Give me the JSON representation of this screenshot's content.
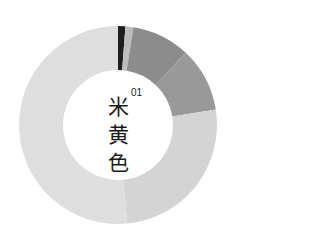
{
  "chart_data": {
    "type": "pie",
    "variant": "donut",
    "index_label": "01",
    "slices": [
      {
        "label": "segment-1",
        "value": 1.2,
        "color": "#1f1f1f"
      },
      {
        "label": "segment-2",
        "value": 1.3,
        "color": "#bdbdbd"
      },
      {
        "label": "segment-3",
        "value": 9.5,
        "color": "#8c8c8c"
      },
      {
        "label": "segment-4",
        "value": 10.5,
        "color": "#999999"
      },
      {
        "label": "segment-5",
        "value": 26.0,
        "color": "#d4d4d4"
      },
      {
        "label": "segment-6",
        "value": 51.5,
        "color": "#dedede"
      }
    ],
    "start_angle_deg": 0,
    "direction": "clockwise",
    "legend": "none"
  },
  "center": {
    "chars": [
      "米",
      "黄",
      "色"
    ],
    "number": "01"
  }
}
